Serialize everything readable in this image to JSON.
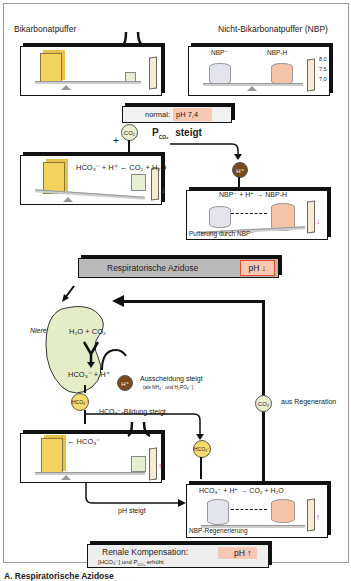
{
  "top": {
    "left_label": "Bikarbonatpuffer",
    "right_label": "Nicht-Bikarbonatpuffer (NBP)",
    "nbp_label": "NBP⁻",
    "nbp_h_label": "NBP-H",
    "scale_ticks": [
      "8,0",
      "7,5",
      "7,0"
    ]
  },
  "normal_box": {
    "label": "normal:",
    "value": "pH 7,4"
  },
  "co2_step": {
    "plus": "+",
    "co2_bubble": "CO₂",
    "pco2_label": "P",
    "pco2_sub": "CO₂",
    "steigt": "steigt"
  },
  "bicarb_reaction": "HCO₃⁻ + H⁺ ← CO₂ + H₂O",
  "h_bubble": "H⁺",
  "nbp_panel": {
    "reaction": "NBP⁻ + H⁺ → NBP-H",
    "caption": "Pufferung durch NBP⁻"
  },
  "acidosis_box": {
    "label": "Respiratorische Azidose",
    "ph": "pH ↓"
  },
  "kidney": {
    "label": "Niere",
    "top_reaction": "H₂O + CO₂",
    "bottom_reaction": "HCO₃⁻ + H⁺",
    "h_bubble": "H⁺",
    "excretion_label": "Ausscheidung steigt",
    "excretion_sub": "(als NH₄⁺ und H₂PO₄⁻)",
    "hco3_bubble": "HCO₃⁻",
    "formation_label": "HCO₃⁻-Bildung steigt"
  },
  "regeneration": {
    "co2_bubble": "CO₂",
    "label": "aus Regeneration"
  },
  "bottom_bicarb": {
    "label": "← HCO₃⁻",
    "ph_rises": "pH steigt"
  },
  "bottom_nbp": {
    "hco3_bubble": "HCO₃⁻",
    "reaction": "HCO₃⁻ + H⁺ → CO₂ + H₂O",
    "caption": "NBP-Regenerierung"
  },
  "compensation_box": {
    "label": "Renale Kompensation:",
    "sub": "[HCO₃⁻] und P",
    "sub_index": "CO₂",
    "sub_end": "erhöht",
    "ph": "pH ↑"
  },
  "caption": "A. Respiratorische Azidose",
  "colors": {
    "bicarb_block": "#f3d25e",
    "nbp_cyl": "#e4e4ec",
    "nbph_cyl": "#f5c4a6",
    "co2": "#eaf0cf",
    "h": "#7a4a1e",
    "hco3": "#f6dc6a",
    "kidney": "#e5ecc8",
    "status_grey": "#b9b9b9",
    "status_pink": "#f7c9b4",
    "alert_red": "#e34a2a"
  }
}
